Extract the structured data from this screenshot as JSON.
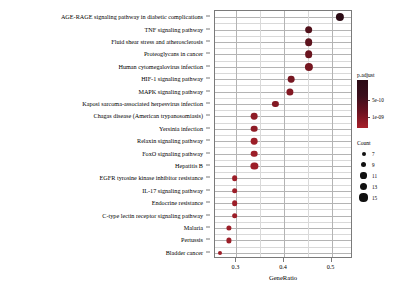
{
  "chart_data": {
    "type": "scatter",
    "title": "",
    "xlabel": "GeneRatio",
    "ylabel": "",
    "xlim": [
      0.255,
      0.545
    ],
    "xticks": [
      0.3,
      0.4,
      0.5
    ],
    "xticklabels": [
      "0.3",
      "0.4",
      "0.5"
    ],
    "grid": true,
    "categories": [
      "AGE-RAGE signaling pathway in diabetic complications",
      "TNF signaling pathway",
      "Fluid shear stress and atherosclerosis",
      "Proteoglycans in cancer",
      "Human cytomegalovirus infection",
      "HIF-1 signaling pathway",
      "MAPK signaling pathway",
      "Kaposi sarcoma-associated herpesvirus infection",
      "Chagas disease (American trypanosomiasis)",
      "Yersinia infection",
      "Relaxin signaling pathway",
      "FoxO signaling pathway",
      "Hepatitis B",
      "EGFR tyrosine kinase inhibitor resistance",
      "IL-17 signaling pathway",
      "Endocrine resistance",
      "C-type lectin receptor signaling pathway",
      "Malaria",
      "Pertussis",
      "Bladder cancer"
    ],
    "points": [
      {
        "term": "AGE-RAGE signaling pathway in diabetic complications",
        "GeneRatio": 0.518,
        "Count": 15,
        "padjust": 1e-10
      },
      {
        "term": "TNF signaling pathway",
        "GeneRatio": 0.452,
        "Count": 14,
        "padjust": 4e-10
      },
      {
        "term": "Fluid shear stress and atherosclerosis",
        "GeneRatio": 0.452,
        "Count": 14,
        "padjust": 5e-10
      },
      {
        "term": "Proteoglycans in cancer",
        "GeneRatio": 0.452,
        "Count": 14,
        "padjust": 6e-10
      },
      {
        "term": "Human cytomegalovirus infection",
        "GeneRatio": 0.452,
        "Count": 15,
        "padjust": 7e-10
      },
      {
        "term": "HIF-1 signaling pathway",
        "GeneRatio": 0.415,
        "Count": 12,
        "padjust": 7e-10
      },
      {
        "term": "MAPK signaling pathway",
        "GeneRatio": 0.412,
        "Count": 13,
        "padjust": 8e-10
      },
      {
        "term": "Kaposi sarcoma-associated herpesvirus infection",
        "GeneRatio": 0.382,
        "Count": 11,
        "padjust": 8e-10
      },
      {
        "term": "Chagas disease (American trypanosomiasis)",
        "GeneRatio": 0.338,
        "Count": 12,
        "padjust": 9e-10
      },
      {
        "term": "Yersinia infection",
        "GeneRatio": 0.338,
        "Count": 12,
        "padjust": 9e-10
      },
      {
        "term": "Relaxin signaling pathway",
        "GeneRatio": 0.338,
        "Count": 12,
        "padjust": 1e-09
      },
      {
        "term": "FoxO signaling pathway",
        "GeneRatio": 0.338,
        "Count": 12,
        "padjust": 1e-09
      },
      {
        "term": "Hepatitis B",
        "GeneRatio": 0.338,
        "Count": 13,
        "padjust": 1e-09
      },
      {
        "term": "EGFR tyrosine kinase inhibitor resistance",
        "GeneRatio": 0.296,
        "Count": 10,
        "padjust": 1e-09
      },
      {
        "term": "IL-17 signaling pathway",
        "GeneRatio": 0.296,
        "Count": 10,
        "padjust": 1e-09
      },
      {
        "term": "Endocrine resistance",
        "GeneRatio": 0.296,
        "Count": 10,
        "padjust": 1e-09
      },
      {
        "term": "C-type lectin receptor signaling pathway",
        "GeneRatio": 0.296,
        "Count": 10,
        "padjust": 1e-09
      },
      {
        "term": "Malaria",
        "GeneRatio": 0.285,
        "Count": 9,
        "padjust": 1e-09
      },
      {
        "term": "Pertussis",
        "GeneRatio": 0.285,
        "Count": 9,
        "padjust": 1e-09
      },
      {
        "term": "Bladder cancer",
        "GeneRatio": 0.265,
        "Count": 7,
        "padjust": 1e-09
      }
    ],
    "legends": {
      "color": {
        "title": "p.adjust",
        "ticks": [
          {
            "value": 5e-10,
            "label": "5e-10",
            "pos": 0.42
          },
          {
            "value": 1e-09,
            "label": "1e-09",
            "pos": 0.78
          }
        ],
        "gradient_high": "#2b0a14",
        "gradient_low": "#a8202a",
        "position": "right"
      },
      "size": {
        "title": "Count",
        "entries": [
          {
            "label": "7",
            "value": 7,
            "px": 4.0
          },
          {
            "label": "9",
            "value": 9,
            "px": 5.2
          },
          {
            "label": "11",
            "value": 11,
            "px": 6.2
          },
          {
            "label": "13",
            "value": 13,
            "px": 7.2
          },
          {
            "label": "15",
            "value": 15,
            "px": 8.2
          }
        ],
        "position": "right"
      }
    }
  }
}
